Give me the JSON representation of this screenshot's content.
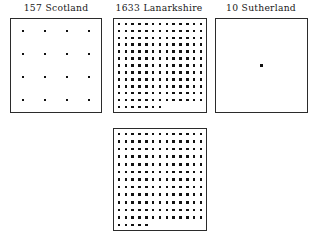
{
  "figure": {
    "type": "dot-quantity-panels",
    "background_color": "#ffffff",
    "dot_color": "#111111",
    "border_color": "#2b2b2b",
    "panels": [
      {
        "id": "scotland",
        "count_label": "157",
        "region_label": "Scotland",
        "full_label": "157 Scotland",
        "dot_total": 16,
        "grid_columns": 4,
        "grid_rows": 4,
        "last_row_dots": 4,
        "dot_size_px": 2.6,
        "has_label": true
      },
      {
        "id": "lanarkshire",
        "count_label": "1633",
        "region_label": "Lanarkshire",
        "full_label": "1633 Lanarkshire",
        "dot_total": 163,
        "grid_columns": 13,
        "grid_rows": 13,
        "last_row_dots": 7,
        "dot_size_px": 2.6,
        "has_label": true
      },
      {
        "id": "sutherland",
        "count_label": "10",
        "region_label": "Sutherland",
        "full_label": "10 Sutherland",
        "dot_total": 1,
        "grid_columns": 1,
        "grid_rows": 1,
        "last_row_dots": 1,
        "dot_size_px": 2.6,
        "has_label": true
      },
      {
        "id": "lanarkshire-continued",
        "count_label": "",
        "region_label": "",
        "full_label": "",
        "dot_total": 161,
        "grid_columns": 13,
        "grid_rows": 13,
        "last_row_dots": 5,
        "dot_size_px": 2.6,
        "has_label": false
      }
    ]
  },
  "chart_data": {
    "type": "bar",
    "title": "",
    "xlabel": "",
    "ylabel": "",
    "categories": [
      "Scotland",
      "Lanarkshire",
      "Sutherland"
    ],
    "values": [
      157,
      1633,
      10
    ],
    "value_labels": [
      "157",
      "1633",
      "10"
    ],
    "units": "dots (1 dot ≈ 10 units)",
    "grid": false,
    "legend": "none"
  }
}
